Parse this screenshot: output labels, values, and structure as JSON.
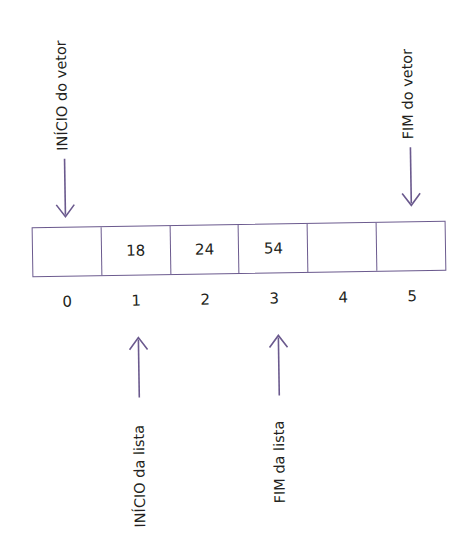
{
  "diagram": {
    "colors": {
      "line": "#6b5a8e",
      "text": "#231f20",
      "background": "#ffffff"
    },
    "array": {
      "cells": [
        {
          "index": "0",
          "value": ""
        },
        {
          "index": "1",
          "value": "18"
        },
        {
          "index": "2",
          "value": "24"
        },
        {
          "index": "3",
          "value": "54"
        },
        {
          "index": "4",
          "value": ""
        },
        {
          "index": "5",
          "value": ""
        }
      ]
    },
    "pointers": {
      "vector_start": {
        "label": "INÍCIO do vetor",
        "points_to_index": "0",
        "direction": "down"
      },
      "vector_end": {
        "label": "FIM do vetor",
        "points_to_index": "5",
        "direction": "down"
      },
      "list_start": {
        "label": "INÍCIO da lista",
        "points_to_index": "1",
        "direction": "up"
      },
      "list_end": {
        "label": "FIM da lista",
        "points_to_index": "3",
        "direction": "up"
      }
    }
  }
}
